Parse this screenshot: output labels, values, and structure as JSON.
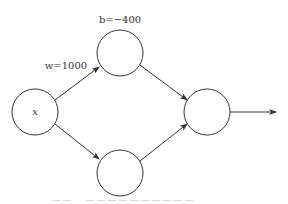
{
  "diagram": {
    "type": "neural-network",
    "nodes": [
      {
        "id": "input",
        "label": "x",
        "cx": 35,
        "cy": 112,
        "r": 23
      },
      {
        "id": "hidden-top",
        "label": "",
        "cx": 120,
        "cy": 53,
        "r": 23
      },
      {
        "id": "hidden-bottom",
        "label": "",
        "cx": 120,
        "cy": 173,
        "r": 23
      },
      {
        "id": "output",
        "label": "",
        "cx": 207,
        "cy": 112,
        "r": 23
      }
    ],
    "edges": [
      {
        "from": "input",
        "to": "hidden-top",
        "label": "w=1000"
      },
      {
        "from": "input",
        "to": "hidden-bottom",
        "label": ""
      },
      {
        "from": "hidden-top",
        "to": "output",
        "label": ""
      },
      {
        "from": "hidden-bottom",
        "to": "output",
        "label": ""
      },
      {
        "from": "output",
        "to": "out",
        "label": ""
      }
    ],
    "labels": {
      "input_node": "x",
      "weight": "w=1000",
      "bias": "b=−400"
    },
    "colors": {
      "stroke": "#333333",
      "background": "#ffffff"
    },
    "caption": {
      "visible": "clipped",
      "text": ""
    }
  }
}
